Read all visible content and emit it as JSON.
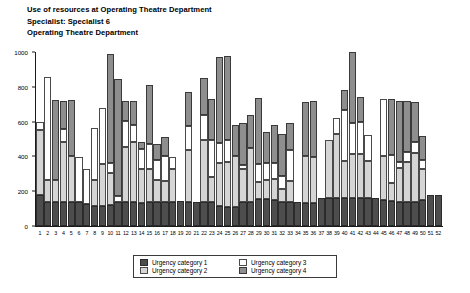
{
  "header": {
    "line1": "Use of resources at Operating Theatre Department",
    "line2": "Specialist: Specialist 6",
    "line3": "Operating Theatre Department"
  },
  "legend": {
    "items": [
      {
        "label": "Urgency category 1",
        "color": "#4d4d4d",
        "key": "c1"
      },
      {
        "label": "Urgency category 2",
        "color": "#d5d5d5",
        "key": "c2"
      },
      {
        "label": "Urgency category 3",
        "color": "#ffffff",
        "key": "c3"
      },
      {
        "label": "Urgency category 4",
        "color": "#8e8e8e",
        "key": "c4"
      }
    ]
  },
  "axis": {
    "y_ticks": [
      0,
      200,
      400,
      600,
      800,
      1000
    ],
    "x_ticks": [
      1,
      2,
      3,
      4,
      5,
      6,
      7,
      8,
      9,
      10,
      11,
      12,
      13,
      14,
      15,
      16,
      17,
      18,
      19,
      20,
      21,
      22,
      23,
      24,
      25,
      26,
      27,
      28,
      29,
      30,
      31,
      32,
      33,
      34,
      35,
      36,
      37,
      38,
      39,
      40,
      41,
      42,
      43,
      44,
      45,
      46,
      47,
      48,
      49,
      50,
      51,
      52
    ]
  },
  "chart_data": {
    "type": "bar",
    "stacked": true,
    "title": "Use of resources at Operating Theatre Department",
    "subtitle": "Specialist: Specialist 6",
    "subtitle2": "Operating Theatre Department",
    "xlabel": "",
    "ylabel": "",
    "ylim": [
      0,
      1000
    ],
    "ytick_step": 200,
    "grid": false,
    "legend_position": "bottom",
    "categories": [
      1,
      2,
      3,
      4,
      5,
      6,
      7,
      8,
      9,
      10,
      11,
      12,
      13,
      14,
      15,
      16,
      17,
      18,
      19,
      20,
      21,
      22,
      23,
      24,
      25,
      26,
      27,
      28,
      29,
      30,
      31,
      32,
      33,
      34,
      35,
      36,
      37,
      38,
      39,
      40,
      41,
      42,
      43,
      44,
      45,
      46,
      47,
      48,
      49,
      50,
      51,
      52
    ],
    "series": [
      {
        "name": "Urgency category 1",
        "color": "#4d4d4d",
        "values": [
          180,
          140,
          140,
          140,
          140,
          140,
          125,
          115,
          115,
          120,
          140,
          140,
          140,
          135,
          140,
          140,
          140,
          140,
          145,
          140,
          140,
          140,
          140,
          115,
          110,
          110,
          140,
          140,
          155,
          155,
          150,
          140,
          140,
          140,
          130,
          130,
          160,
          160,
          160,
          160,
          160,
          160,
          160,
          160,
          150,
          145,
          140,
          140,
          140,
          150,
          180,
          180
        ]
      },
      {
        "name": "Urgency category 2",
        "color": "#d5d5d5",
        "values": [
          370,
          125,
          125,
          345,
          260,
          0,
          0,
          150,
          240,
          185,
          0,
          315,
          340,
          195,
          190,
          125,
          120,
          185,
          0,
          295,
          0,
          355,
          140,
          245,
          260,
          290,
          190,
          310,
          100,
          110,
          120,
          75,
          120,
          0,
          270,
          265,
          0,
          335,
          370,
          215,
          255,
          255,
          215,
          0,
          255,
          100,
          195,
          230,
          280,
          175,
          0,
          0
        ]
      },
      {
        "name": "Urgency category 3",
        "color": "#ffffff",
        "values": [
          45,
          590,
          0,
          70,
          0,
          255,
          205,
          300,
          325,
          55,
          35,
          150,
          100,
          115,
          140,
          115,
          140,
          70,
          0,
          140,
          0,
          145,
          215,
          115,
          125,
          0,
          20,
          0,
          100,
          100,
          95,
          70,
          175,
          0,
          0,
          0,
          0,
          0,
          90,
          290,
          175,
          185,
          150,
          0,
          325,
          165,
          35,
          55,
          60,
          55,
          0,
          0
        ]
      },
      {
        "name": "Urgency category 4",
        "color": "#8e8e8e",
        "values": [
          0,
          0,
          460,
          165,
          325,
          0,
          0,
          0,
          0,
          630,
          670,
          115,
          140,
          40,
          340,
          90,
          110,
          0,
          0,
          195,
          0,
          210,
          235,
          495,
          480,
          180,
          240,
          190,
          380,
          175,
          215,
          245,
          160,
          0,
          310,
          325,
          0,
          0,
          0,
          115,
          410,
          140,
          0,
          0,
          0,
          320,
          350,
          295,
          235,
          140,
          0,
          0
        ]
      }
    ]
  }
}
